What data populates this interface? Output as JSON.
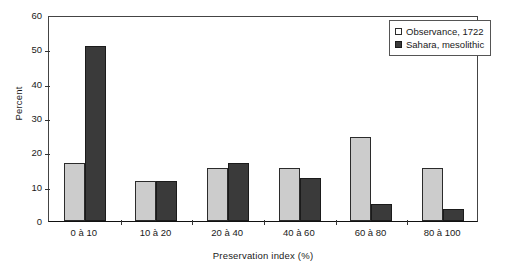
{
  "chart_data": {
    "type": "bar",
    "title": "",
    "xlabel": "Preservation index (%)",
    "ylabel": "Percent",
    "categories": [
      "0 à 10",
      "10 à 20",
      "20 à 40",
      "40 à 60",
      "60 à 80",
      "80 à 100"
    ],
    "series": [
      {
        "name": "Observance, 1722",
        "color": "#cccccc",
        "values": [
          17,
          11.8,
          15.5,
          15.5,
          24.5,
          15.5
        ]
      },
      {
        "name": "Sahara, mesolithic",
        "color": "#3a3a3a",
        "values": [
          51,
          11.6,
          17,
          12.5,
          5,
          3.5
        ]
      }
    ],
    "ylim": [
      0,
      60
    ],
    "yticks": [
      0,
      10,
      20,
      30,
      40,
      50,
      60
    ],
    "ytick_labels": [
      "0",
      "10",
      "20",
      "30",
      "40",
      "50",
      "60"
    ],
    "grid": false,
    "legend_position": "top-right"
  }
}
